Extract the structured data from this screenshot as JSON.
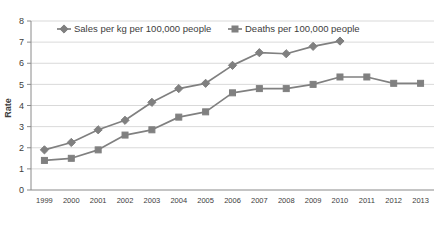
{
  "chart_data": {
    "type": "line",
    "title": "",
    "xlabel": "",
    "ylabel": "Rate",
    "ylim": [
      0,
      8
    ],
    "ytick_step": 1,
    "grid": true,
    "legend_position": "top",
    "categories": [
      "1999",
      "2000",
      "2001",
      "2002",
      "2003",
      "2004",
      "2005",
      "2006",
      "2007",
      "2008",
      "2009",
      "2010",
      "2011",
      "2012",
      "2013"
    ],
    "yticks": [
      "0",
      "1",
      "2",
      "3",
      "4",
      "5",
      "6",
      "7",
      "8"
    ],
    "series": [
      {
        "name": "Sales per kg per 100,000 people",
        "marker": "diamond",
        "color": "#808080",
        "values": [
          1.9,
          2.25,
          2.85,
          3.3,
          4.15,
          4.8,
          5.05,
          5.9,
          6.5,
          6.45,
          6.8,
          7.05,
          null,
          null,
          null
        ]
      },
      {
        "name": "Deaths per 100,000 people",
        "marker": "square",
        "color": "#808080",
        "values": [
          1.4,
          1.5,
          1.9,
          2.6,
          2.85,
          3.45,
          3.7,
          4.6,
          4.8,
          4.8,
          5.0,
          5.35,
          5.35,
          5.05,
          5.05
        ]
      }
    ]
  },
  "legend": {
    "items": [
      {
        "label": "Sales per kg per 100,000 people",
        "marker": "diamond"
      },
      {
        "label": "Deaths per 100,000 people",
        "marker": "square"
      }
    ]
  },
  "colors": {
    "series": "#808080",
    "gridline": "#c9c9c9",
    "axis": "#8a8a8a",
    "text": "#3d3d3d",
    "background": "#ffffff"
  }
}
